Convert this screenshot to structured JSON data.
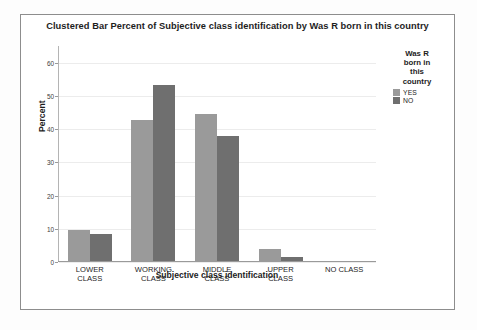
{
  "chart_data": {
    "type": "bar",
    "title": "Clustered Bar Percent of Subjective class identification by Was R born in this country",
    "xlabel": "Subjective class identification",
    "ylabel": "Percent",
    "categories": [
      "LOWER\nCLASS",
      "WORKING\nCLASS",
      "MIDDLE\nCLASS",
      "UPPER\nCLASS",
      "NO CLASS"
    ],
    "series": [
      {
        "name": "YES",
        "color": "#9a9a9a",
        "values": [
          9.2,
          42.3,
          44.3,
          3.7,
          0
        ]
      },
      {
        "name": "NO",
        "color": "#6f6f6f",
        "values": [
          8.0,
          53.0,
          37.5,
          1.1,
          0
        ]
      }
    ],
    "legend_title": "Was R\nborn in\nthis\ncountry",
    "legend_position": "right",
    "ylim": [
      0,
      65
    ],
    "yticks": [
      0,
      10,
      20,
      30,
      40,
      50,
      60
    ],
    "ytick_labels": [
      "0",
      "10",
      "20",
      "30",
      "40",
      "50",
      "60"
    ],
    "grid": true
  }
}
